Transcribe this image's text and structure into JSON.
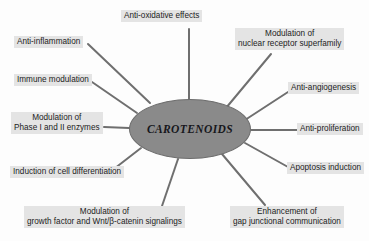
{
  "diagram": {
    "type": "radial-hub-and-spoke",
    "title_text": "CAROTENOIDS",
    "hub": {
      "label": "CAROTENOIDS",
      "fill_color": "#8a8a8a",
      "stroke_color": "#6d6d6d"
    },
    "spoke_color": "#6f6f6f",
    "label_background": "#e4e4e4",
    "nodes": [
      {
        "id": "anti-oxidative-effects",
        "lines": [
          "Anti-oxidative effects"
        ],
        "line1": "Anti-oxidative effects",
        "line2": ""
      },
      {
        "id": "modulation-of-nuclear-receptor-superfamily",
        "lines": [
          "Modulation of",
          "nuclear receptor superfamily"
        ],
        "line1": "Modulation of",
        "line2": "nuclear receptor superfamily"
      },
      {
        "id": "anti-angiogenesis",
        "lines": [
          "Anti-angiogenesis"
        ],
        "line1": "Anti-angiogenesis",
        "line2": ""
      },
      {
        "id": "anti-proliferation",
        "lines": [
          "Anti-proliferation"
        ],
        "line1": "Anti-proliferation",
        "line2": ""
      },
      {
        "id": "apoptosis-induction",
        "lines": [
          "Apoptosis induction"
        ],
        "line1": "Apoptosis induction",
        "line2": ""
      },
      {
        "id": "enhancement-of-gap-junctional-communication",
        "lines": [
          "Enhancement of",
          "gap junctional communication"
        ],
        "line1": "Enhancement of",
        "line2": "gap junctional communication"
      },
      {
        "id": "modulation-of-growth-factor-and-wnt-beta-catenin-signalings",
        "lines": [
          "Modulation of",
          "growth factor and Wnt/β-catenin signalings"
        ],
        "line1": "Modulation of",
        "line2": "growth factor and Wnt/β-catenin signalings"
      },
      {
        "id": "induction-of-cell-differentiation",
        "lines": [
          "Induction of cell differentiation"
        ],
        "line1": "Induction of cell differentiation",
        "line2": ""
      },
      {
        "id": "modulation-of-phase-i-and-ii-enzymes",
        "lines": [
          "Modulation of",
          "Phase I and II enzymes"
        ],
        "line1": "Modulation of",
        "line2": "Phase I and II enzymes"
      },
      {
        "id": "immune-modulation",
        "lines": [
          "Immune modulation"
        ],
        "line1": "Immune modulation",
        "line2": ""
      },
      {
        "id": "anti-inflammation",
        "lines": [
          "Anti-inflammation"
        ],
        "line1": "Anti-inflammation",
        "line2": ""
      }
    ]
  }
}
